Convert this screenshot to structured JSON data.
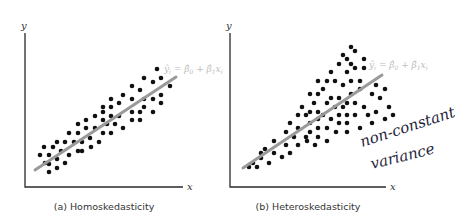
{
  "chart_data": [
    {
      "type": "scatter",
      "title": "(a) Homoskedasticity",
      "xlabel": "x",
      "ylabel": "y",
      "regression_equation": "ŷᵢ = β̂₀ + β̂₁xᵢ",
      "annotation": "",
      "grid": false,
      "regression_line_px": [
        [
          35,
          170
        ],
        [
          176,
          77
        ]
      ],
      "points_px": [
        [
          157,
          69
        ],
        [
          144,
          78
        ],
        [
          153,
          82
        ],
        [
          161,
          78
        ],
        [
          170,
          86
        ],
        [
          132,
          86
        ],
        [
          140,
          90
        ],
        [
          123,
          95
        ],
        [
          144,
          99
        ],
        [
          153,
          99
        ],
        [
          161,
          95
        ],
        [
          161,
          103
        ],
        [
          111,
          99
        ],
        [
          119,
          103
        ],
        [
          132,
          99
        ],
        [
          103,
          107
        ],
        [
          111,
          107
        ],
        [
          144,
          107
        ],
        [
          153,
          112
        ],
        [
          132,
          112
        ],
        [
          140,
          112
        ],
        [
          95,
          116
        ],
        [
          103,
          112
        ],
        [
          111,
          116
        ],
        [
          119,
          116
        ],
        [
          86,
          120
        ],
        [
          103,
          120
        ],
        [
          132,
          120
        ],
        [
          140,
          120
        ],
        [
          78,
          124
        ],
        [
          95,
          128
        ],
        [
          86,
          128
        ],
        [
          107,
          124
        ],
        [
          115,
          124
        ],
        [
          123,
          128
        ],
        [
          69,
          133
        ],
        [
          78,
          133
        ],
        [
          103,
          133
        ],
        [
          111,
          133
        ],
        [
          90,
          138
        ],
        [
          65,
          142
        ],
        [
          57,
          142
        ],
        [
          74,
          142
        ],
        [
          82,
          142
        ],
        [
          99,
          142
        ],
        [
          44,
          147
        ],
        [
          53,
          147
        ],
        [
          91,
          147
        ],
        [
          61,
          151
        ],
        [
          78,
          151
        ],
        [
          82,
          151
        ],
        [
          40,
          155
        ],
        [
          49,
          155
        ],
        [
          69,
          155
        ],
        [
          57,
          159
        ],
        [
          45,
          163
        ],
        [
          49,
          164
        ],
        [
          65,
          163
        ],
        [
          57,
          168
        ],
        [
          49,
          172
        ]
      ]
    },
    {
      "type": "scatter",
      "title": "(b) Heteroskedasticity",
      "xlabel": "x",
      "ylabel": "y",
      "regression_equation": "ŷᵢ = β̂₀ + β̂₁xᵢ",
      "annotation": [
        "non-constant",
        "variance"
      ],
      "grid": false,
      "regression_line_px": [
        [
          243,
          168
        ],
        [
          382,
          75
        ]
      ],
      "points_px": [
        [
          351,
          47
        ],
        [
          355,
          51
        ],
        [
          343,
          55
        ],
        [
          347,
          59
        ],
        [
          364,
          59
        ],
        [
          339,
          64
        ],
        [
          351,
          64
        ],
        [
          331,
          72
        ],
        [
          347,
          72
        ],
        [
          355,
          68
        ],
        [
          364,
          68
        ],
        [
          318,
          81
        ],
        [
          327,
          81
        ],
        [
          335,
          81
        ],
        [
          351,
          81
        ],
        [
          360,
          81
        ],
        [
          323,
          89
        ],
        [
          343,
          85
        ],
        [
          360,
          89
        ],
        [
          376,
          85
        ],
        [
          385,
          89
        ],
        [
          310,
          94
        ],
        [
          318,
          94
        ],
        [
          331,
          98
        ],
        [
          339,
          98
        ],
        [
          351,
          94
        ],
        [
          372,
          94
        ],
        [
          314,
          103
        ],
        [
          327,
          103
        ],
        [
          347,
          103
        ],
        [
          355,
          103
        ],
        [
          380,
          98
        ],
        [
          302,
          107
        ],
        [
          310,
          112
        ],
        [
          318,
          112
        ],
        [
          335,
          107
        ],
        [
          343,
          107
        ],
        [
          364,
          107
        ],
        [
          376,
          112
        ],
        [
          389,
          107
        ],
        [
          298,
          115
        ],
        [
          306,
          115
        ],
        [
          323,
          115
        ],
        [
          331,
          119
        ],
        [
          339,
          115
        ],
        [
          347,
          115
        ],
        [
          355,
          115
        ],
        [
          368,
          115
        ],
        [
          385,
          119
        ],
        [
          393,
          115
        ],
        [
          290,
          123
        ],
        [
          298,
          128
        ],
        [
          310,
          123
        ],
        [
          318,
          119
        ],
        [
          327,
          128
        ],
        [
          339,
          123
        ],
        [
          347,
          123
        ],
        [
          372,
          123
        ],
        [
          360,
          128
        ],
        [
          286,
          132
        ],
        [
          294,
          137
        ],
        [
          310,
          132
        ],
        [
          318,
          128
        ],
        [
          336,
          132
        ],
        [
          347,
          132
        ],
        [
          306,
          137
        ],
        [
          318,
          137
        ],
        [
          327,
          141
        ],
        [
          274,
          141
        ],
        [
          286,
          145
        ],
        [
          298,
          145
        ],
        [
          307,
          141
        ],
        [
          315,
          145
        ],
        [
          265,
          149
        ],
        [
          274,
          153
        ],
        [
          290,
          153
        ],
        [
          282,
          157
        ],
        [
          261,
          153
        ],
        [
          261,
          158
        ],
        [
          253,
          163
        ],
        [
          269,
          163
        ],
        [
          249,
          167
        ],
        [
          257,
          167
        ]
      ]
    }
  ],
  "panels": {
    "a": {
      "caption": "(a) Homoskedasticity",
      "ylabel": "y",
      "xlabel": "x",
      "eq_main": "ŷ",
      "eq_rest": "i = β̂0 + β̂1xi"
    },
    "b": {
      "caption": "(b) Heteroskedasticity",
      "ylabel": "y",
      "xlabel": "x",
      "eq_main": "ŷ",
      "eq_rest": "i = β̂0 + β̂1xi",
      "note_line1": "non-constant",
      "note_line2": "variance"
    }
  },
  "colors": {
    "points": "#111111",
    "regression_line": "#9a9a9a",
    "equation_text": "#bdbdbd",
    "handwriting": "#1e1e3a"
  }
}
